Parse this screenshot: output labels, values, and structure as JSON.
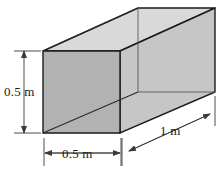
{
  "figure": {
    "name": "rectangular-duct-dimensions",
    "shape": "rectangular prism",
    "projection": "oblique",
    "background_color": "#ffffff"
  },
  "labels": {
    "height": "0.5 m",
    "width": "0.5 m",
    "depth": "1 m"
  },
  "dimensions": {
    "height_value": 0.5,
    "width_value": 0.5,
    "depth_value": 1,
    "unit": "m"
  },
  "colors": {
    "front_face": "#b2b2b2",
    "top_face": "#d9d9d9",
    "right_face": "#c6c6c6",
    "outline": "#1a1a1a",
    "interior_line": "#5a5a5a",
    "dimension_line": "#3a3a3a",
    "label_text": "#1a1a1a"
  },
  "geometry": {
    "front_face_points": "43,51 120,51 120,133 43,133",
    "top_face_points": "43,51 120,51 215,8 138,8",
    "right_face_points": "120,51 215,8 215,92 120,133",
    "interior_vertical": {
      "x1": 138,
      "y1": 8,
      "x2": 138,
      "y2": 92
    },
    "interior_horizontal": {
      "x1": 138,
      "y1": 92,
      "x2": 215,
      "y2": 92
    },
    "interior_diagonal_top": {
      "x1": 43,
      "y1": 51,
      "x2": 138,
      "y2": 8
    },
    "interior_diagonal_bottom": {
      "x1": 43,
      "y1": 133,
      "x2": 138,
      "y2": 92
    }
  },
  "dimension_lines": {
    "height": {
      "axis_x": 24,
      "top_y": 51,
      "bottom_y": 133,
      "ext_top": "14,51 40,51",
      "ext_bottom": "14,133 40,133"
    },
    "width": {
      "axis_y": 153,
      "left_x": 44,
      "right_x": 121,
      "ext_left": "44,137 44,165",
      "ext_right": "121,137 121,165"
    },
    "depth": {
      "start": "128,152",
      "end": "212,113",
      "ext_near": "122,137 122,165",
      "ext_far": "215,96 215,124"
    }
  }
}
